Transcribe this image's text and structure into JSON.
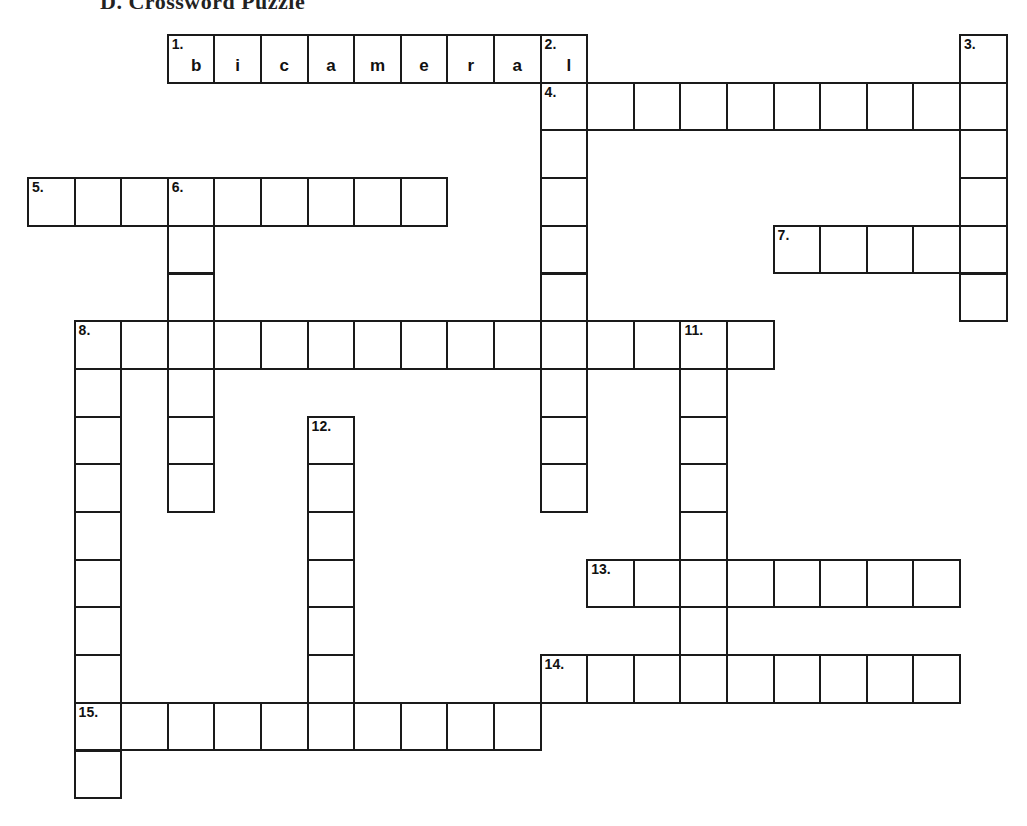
{
  "title": "D. Crossword Puzzle",
  "grid": {
    "origin_x": 28,
    "origin_y": 35,
    "cell_w": 46.6,
    "cell_h": 47.7,
    "border_color": "#1a1a1a"
  },
  "entries": [
    {
      "number": "1.",
      "direction": "across",
      "row": 0,
      "col": 3,
      "length": 9,
      "answer_shown": [
        "b",
        "i",
        "c",
        "a",
        "m",
        "e",
        "r",
        "a",
        "l"
      ]
    },
    {
      "number": "2.",
      "direction": "down",
      "row": 0,
      "col": 11,
      "length": 10,
      "answer_shown": [
        "l",
        "",
        "",
        "",
        "",
        "",
        "",
        "",
        "",
        ""
      ]
    },
    {
      "number": "3.",
      "direction": "down",
      "row": 0,
      "col": 20,
      "length": 6
    },
    {
      "number": "4.",
      "direction": "across",
      "row": 1,
      "col": 11,
      "length": 10
    },
    {
      "number": "5.",
      "direction": "across",
      "row": 3,
      "col": 0,
      "length": 9
    },
    {
      "number": "6.",
      "direction": "down",
      "row": 3,
      "col": 3,
      "length": 7
    },
    {
      "number": "7.",
      "direction": "across",
      "row": 4,
      "col": 16,
      "length": 5
    },
    {
      "number": "8.",
      "direction": "across",
      "row": 6,
      "col": 1,
      "length": 15
    },
    {
      "number": "8.",
      "direction": "down",
      "row": 6,
      "col": 1,
      "length": 10
    },
    {
      "number": "11.",
      "direction": "down",
      "row": 6,
      "col": 14,
      "length": 8
    },
    {
      "number": "12.",
      "direction": "down",
      "row": 8,
      "col": 6,
      "length": 7
    },
    {
      "number": "13.",
      "direction": "across",
      "row": 11,
      "col": 12,
      "length": 8
    },
    {
      "number": "14.",
      "direction": "across",
      "row": 13,
      "col": 11,
      "length": 9
    },
    {
      "number": "15.",
      "direction": "across",
      "row": 14,
      "col": 1,
      "length": 10
    }
  ]
}
